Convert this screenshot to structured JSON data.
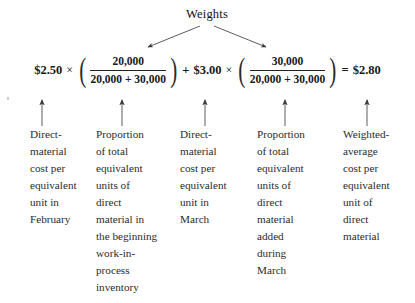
{
  "figure": {
    "weights_label": "Weights",
    "equation": {
      "term1_price": "$2.50",
      "times1": "×",
      "fraction1": {
        "numerator": "20,000",
        "denominator": "20,000 + 30,000"
      },
      "plus": "+",
      "term2_price": "$3.00",
      "times2": "×",
      "fraction2": {
        "numerator": "30,000",
        "denominator": "20,000 + 30,000"
      },
      "equals": "=",
      "result": "$2.80",
      "paren_open": "(",
      "paren_close": ")"
    },
    "captions": [
      {
        "id": "direct-material-cost-february",
        "lines": [
          "Direct-",
          "material",
          "cost per",
          "equivalent",
          "unit in",
          "February"
        ]
      },
      {
        "id": "proportion-beginning-wip",
        "lines": [
          "Proportion",
          "of total",
          "equivalent",
          "units of",
          "direct",
          "material in",
          "the beginning",
          "work-in-",
          "process",
          "inventory"
        ]
      },
      {
        "id": "direct-material-cost-march",
        "lines": [
          "Direct-",
          "material",
          "cost per",
          "equivalent",
          "unit in",
          "March"
        ]
      },
      {
        "id": "proportion-added-during-march",
        "lines": [
          "Proportion",
          "of total",
          "equivalent",
          "units of",
          "direct",
          "material",
          "added",
          "during",
          "March"
        ]
      },
      {
        "id": "weighted-average-cost",
        "lines": [
          "Weighted-",
          "average",
          "cost per",
          "equivalent",
          "unit of",
          "direct",
          "material"
        ]
      }
    ],
    "colors": {
      "ink": "#1c1c1c",
      "arrow": "#3a3a3a",
      "background": "#ffffff"
    }
  }
}
